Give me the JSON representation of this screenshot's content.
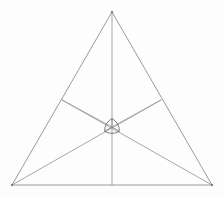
{
  "figure": {
    "background_color": "#fdfdfd",
    "line_color": "#8f8f93",
    "center_shape_color": "#6d6d72",
    "canvas": {
      "width": 224,
      "height": 198
    }
  },
  "chart_data": {
    "type": "scatter",
    "subtitle": "",
    "xlabel": "",
    "ylabel": "",
    "xlim": [
      0,
      224
    ],
    "ylim": [
      0,
      198
    ],
    "grid": false,
    "legend": "none",
    "annotations": [],
    "points": [
      {
        "name": "apex",
        "x": 112,
        "y": 12
      },
      {
        "name": "bottom-left",
        "x": 12,
        "y": 185
      },
      {
        "name": "bottom-right",
        "x": 212,
        "y": 185
      },
      {
        "name": "centroid",
        "x": 112,
        "y": 127
      },
      {
        "name": "left-side-point",
        "x": 62,
        "y": 100
      },
      {
        "name": "right-side-point",
        "x": 161,
        "y": 100
      }
    ],
    "series": [
      {
        "name": "outer-triangle",
        "kind": "polygon",
        "closed": true,
        "x": [
          112,
          12,
          212
        ],
        "y": [
          12,
          185,
          185
        ]
      },
      {
        "name": "cevian-apex-to-base",
        "kind": "segment",
        "x": [
          112,
          112
        ],
        "y": [
          12,
          185
        ]
      },
      {
        "name": "cevian-bottom-left-to-right-side",
        "kind": "segment",
        "x": [
          12,
          161
        ],
        "y": [
          185,
          100
        ]
      },
      {
        "name": "cevian-bottom-right-to-left-side",
        "kind": "segment",
        "x": [
          212,
          62
        ],
        "y": [
          185,
          100
        ]
      },
      {
        "name": "spoke-centroid-to-left-side",
        "kind": "segment",
        "x": [
          112,
          62
        ],
        "y": [
          127,
          100
        ]
      },
      {
        "name": "spoke-centroid-to-right-side",
        "kind": "segment",
        "x": [
          112,
          161
        ],
        "y": [
          127,
          100
        ]
      }
    ],
    "center_shape": {
      "name": "reuleaux-triangle",
      "orientation": "point-up",
      "center_x": 112,
      "center_y": 127,
      "radius": 8.5,
      "inner_lines": 3,
      "inner_pattern": "three-arcs-meeting-at-center"
    }
  }
}
